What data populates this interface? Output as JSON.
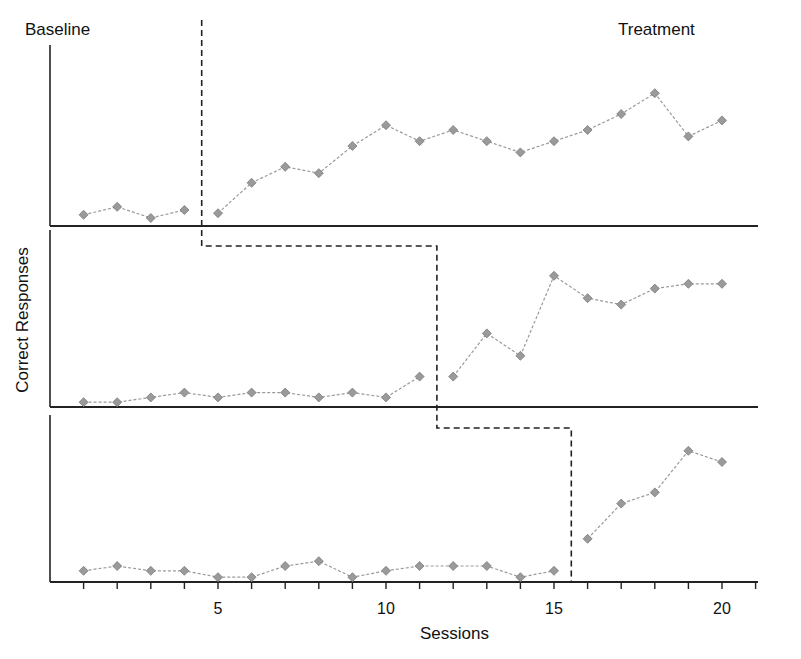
{
  "chart_data": {
    "type": "line",
    "title": "",
    "subtitle": "Multiple-baseline design (three panels)",
    "xlabel": "Sessions",
    "ylabel": "Correct Responses",
    "phase_labels": [
      "Baseline",
      "Treatment"
    ],
    "x_ticks": [
      5,
      10,
      15,
      20
    ],
    "xlim": [
      0,
      21
    ],
    "grid": false,
    "legend": null,
    "panels": [
      {
        "name": "Panel 1",
        "phase_change_after_session": 4.5,
        "points": [
          {
            "x": 1,
            "y": 0.7
          },
          {
            "x": 2,
            "y": 1.2
          },
          {
            "x": 3,
            "y": 0.5
          },
          {
            "x": 4,
            "y": 1.0
          },
          {
            "x": 5,
            "y": 0.8
          },
          {
            "x": 6,
            "y": 2.7
          },
          {
            "x": 7,
            "y": 3.7
          },
          {
            "x": 8,
            "y": 3.3
          },
          {
            "x": 9,
            "y": 5.0
          },
          {
            "x": 10,
            "y": 6.3
          },
          {
            "x": 11,
            "y": 5.3
          },
          {
            "x": 12,
            "y": 6.0
          },
          {
            "x": 13,
            "y": 5.3
          },
          {
            "x": 14,
            "y": 4.6
          },
          {
            "x": 15,
            "y": 5.3
          },
          {
            "x": 16,
            "y": 6.0
          },
          {
            "x": 17,
            "y": 7.0
          },
          {
            "x": 18,
            "y": 8.3
          },
          {
            "x": 19,
            "y": 5.6
          },
          {
            "x": 20,
            "y": 6.6
          }
        ]
      },
      {
        "name": "Panel 2",
        "phase_change_after_session": 11.5,
        "points": [
          {
            "x": 1,
            "y": 0.3
          },
          {
            "x": 2,
            "y": 0.3
          },
          {
            "x": 3,
            "y": 0.6
          },
          {
            "x": 4,
            "y": 0.9
          },
          {
            "x": 5,
            "y": 0.6
          },
          {
            "x": 6,
            "y": 0.9
          },
          {
            "x": 7,
            "y": 0.9
          },
          {
            "x": 8,
            "y": 0.6
          },
          {
            "x": 9,
            "y": 0.9
          },
          {
            "x": 10,
            "y": 0.6
          },
          {
            "x": 11,
            "y": 1.9
          },
          {
            "x": 12,
            "y": 1.9
          },
          {
            "x": 13,
            "y": 4.6
          },
          {
            "x": 14,
            "y": 3.2
          },
          {
            "x": 15,
            "y": 8.2
          },
          {
            "x": 16,
            "y": 6.8
          },
          {
            "x": 17,
            "y": 6.4
          },
          {
            "x": 18,
            "y": 7.4
          },
          {
            "x": 19,
            "y": 7.7
          },
          {
            "x": 20,
            "y": 7.7
          }
        ]
      },
      {
        "name": "Panel 3",
        "phase_change_after_session": 15.5,
        "points": [
          {
            "x": 1,
            "y": 0.7
          },
          {
            "x": 2,
            "y": 1.0
          },
          {
            "x": 3,
            "y": 0.7
          },
          {
            "x": 4,
            "y": 0.7
          },
          {
            "x": 5,
            "y": 0.3
          },
          {
            "x": 6,
            "y": 0.3
          },
          {
            "x": 7,
            "y": 1.0
          },
          {
            "x": 8,
            "y": 1.3
          },
          {
            "x": 9,
            "y": 0.3
          },
          {
            "x": 10,
            "y": 0.7
          },
          {
            "x": 11,
            "y": 1.0
          },
          {
            "x": 12,
            "y": 1.0
          },
          {
            "x": 13,
            "y": 1.0
          },
          {
            "x": 14,
            "y": 0.3
          },
          {
            "x": 15,
            "y": 0.7
          },
          {
            "x": 16,
            "y": 2.7
          },
          {
            "x": 17,
            "y": 4.9
          },
          {
            "x": 18,
            "y": 5.6
          },
          {
            "x": 19,
            "y": 8.2
          },
          {
            "x": 20,
            "y": 7.5
          }
        ]
      }
    ]
  },
  "labels": {
    "baseline": "Baseline",
    "treatment": "Treatment",
    "ylabel": "Correct Responses",
    "xlabel": "Sessions",
    "ticks": [
      "5",
      "10",
      "15",
      "20"
    ]
  },
  "colors": {
    "marker": "#9a9a9a",
    "marker_stroke": "#7a7a7a",
    "line": "#9a9a9a",
    "axis": "#222222",
    "phase_line": "#222222"
  }
}
